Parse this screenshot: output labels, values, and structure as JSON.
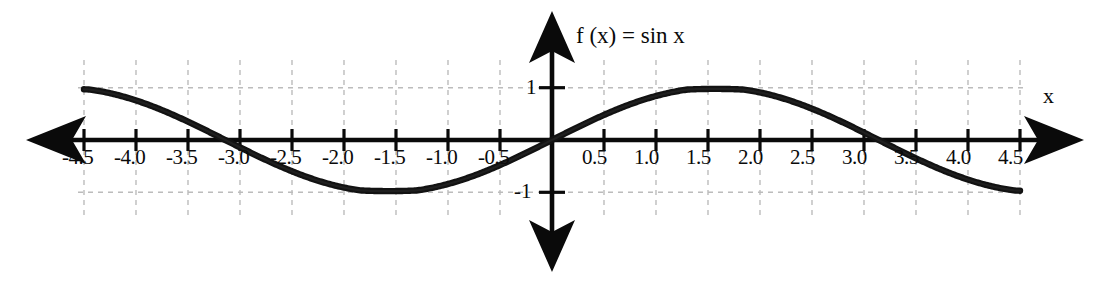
{
  "figure": {
    "title_label": "f (x) = sin x",
    "x_axis_label": "x",
    "background_color": "#ffffff",
    "curve_color": "#121212",
    "axis_color": "#0a0a0a",
    "grid_color": "#b9b9b9"
  },
  "chart_data": {
    "type": "line",
    "title": "f (x) = sin x",
    "xlabel": "x",
    "ylabel": "",
    "xlim": [
      -4.5,
      4.5
    ],
    "ylim": [
      -1.35,
      1.35
    ],
    "grid": true,
    "legend": null,
    "x_ticks": [
      -4.5,
      -4.0,
      -3.5,
      -3.0,
      -2.5,
      -2.0,
      -1.5,
      -1.0,
      -0.5,
      0.5,
      1.0,
      1.5,
      2.0,
      2.5,
      3.0,
      3.5,
      4.0,
      4.5
    ],
    "x_tick_labels": [
      "-4.5",
      "-4.0",
      "-3.5",
      "-3.0",
      "-2.5",
      "-2.0",
      "-1.5",
      "-1.0",
      "-0.5",
      "0.5",
      "1.0",
      "1.5",
      "2.0",
      "2.5",
      "3.0",
      "3.5",
      "4.0",
      "4.5"
    ],
    "y_ticks": [
      1,
      -1
    ],
    "y_tick_labels": [
      "1",
      "-1"
    ],
    "series": [
      {
        "name": "f(x) = sin x",
        "expression": "sin(x)",
        "x": [
          -4.5,
          -4.25,
          -4.0,
          -3.75,
          -3.5,
          -3.25,
          -3.0,
          -2.75,
          -2.5,
          -2.25,
          -2.0,
          -1.75,
          -1.5,
          -1.25,
          -1.0,
          -0.75,
          -0.5,
          -0.25,
          0,
          0.25,
          0.5,
          0.75,
          1.0,
          1.25,
          1.5,
          1.75,
          2.0,
          2.25,
          2.5,
          2.75,
          3.0,
          3.25,
          3.5,
          3.75,
          4.0,
          4.25,
          4.5
        ],
        "y": [
          0.978,
          0.895,
          0.757,
          0.572,
          0.351,
          0.108,
          -0.141,
          -0.382,
          -0.599,
          -0.778,
          -0.909,
          -0.984,
          -0.997,
          -0.949,
          -0.841,
          -0.682,
          -0.479,
          -0.247,
          0.0,
          0.247,
          0.479,
          0.682,
          0.841,
          0.949,
          0.997,
          0.984,
          0.909,
          0.778,
          0.599,
          0.382,
          0.141,
          -0.108,
          -0.351,
          -0.572,
          -0.757,
          -0.895,
          -0.978
        ]
      }
    ]
  }
}
